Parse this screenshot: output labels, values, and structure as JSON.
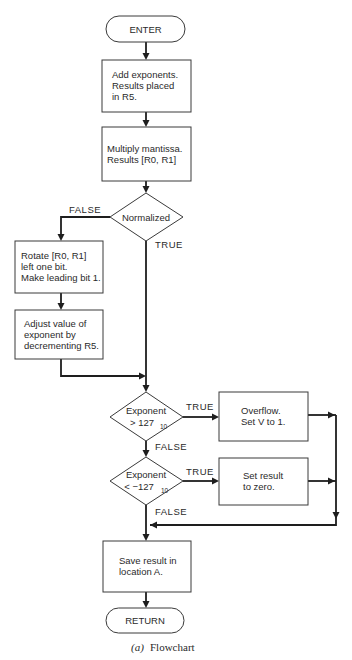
{
  "diagram": {
    "type": "flowchart",
    "caption": {
      "prefix": "(a)",
      "label": "Flowchart"
    },
    "nodes": {
      "enter": {
        "shape": "terminator",
        "text": "ENTER"
      },
      "add_exponents": {
        "shape": "process",
        "lines": [
          "Add exponents.",
          "Results placed",
          "in R5."
        ]
      },
      "multiply_mantissa": {
        "shape": "process",
        "lines": [
          "Multiply mantissa.",
          "Results [R0, R1]"
        ]
      },
      "normalized": {
        "shape": "decision",
        "lines": [
          "Normalized"
        ]
      },
      "rotate": {
        "shape": "process",
        "lines": [
          "Rotate [R0, R1]",
          "left one bit.",
          "Make leading bit 1."
        ]
      },
      "adjust": {
        "shape": "process",
        "lines": [
          "Adjust value of",
          "exponent by",
          "decrementing R5."
        ]
      },
      "exp_gt": {
        "shape": "decision",
        "line1": "Exponent",
        "line2_main": "> 127",
        "line2_sub": "10"
      },
      "overflow": {
        "shape": "process",
        "lines": [
          "Overflow.",
          "Set V to 1."
        ]
      },
      "exp_lt": {
        "shape": "decision",
        "line1": "Exponent",
        "line2_main": "< −127",
        "line2_sub": "10"
      },
      "set_zero": {
        "shape": "process",
        "lines": [
          "Set result",
          "to zero."
        ]
      },
      "save": {
        "shape": "process",
        "lines": [
          "Save result in",
          "location A."
        ]
      },
      "return": {
        "shape": "terminator",
        "text": "RETURN"
      }
    },
    "edge_labels": {
      "normalized_false": "FALSE",
      "normalized_true": "TRUE",
      "exp_gt_true": "TRUE",
      "exp_gt_false": "FALSE",
      "exp_lt_true": "TRUE",
      "exp_lt_false": "FALSE"
    },
    "edges": [
      [
        "enter",
        "add_exponents"
      ],
      [
        "add_exponents",
        "multiply_mantissa"
      ],
      [
        "multiply_mantissa",
        "normalized"
      ],
      [
        "normalized",
        "rotate",
        "FALSE"
      ],
      [
        "normalized",
        "exp_gt",
        "TRUE"
      ],
      [
        "rotate",
        "adjust"
      ],
      [
        "adjust",
        "exp_gt"
      ],
      [
        "exp_gt",
        "overflow",
        "TRUE"
      ],
      [
        "exp_gt",
        "exp_lt",
        "FALSE"
      ],
      [
        "exp_lt",
        "set_zero",
        "TRUE"
      ],
      [
        "exp_lt",
        "save",
        "FALSE"
      ],
      [
        "overflow",
        "save"
      ],
      [
        "set_zero",
        "save"
      ],
      [
        "save",
        "return"
      ]
    ]
  }
}
